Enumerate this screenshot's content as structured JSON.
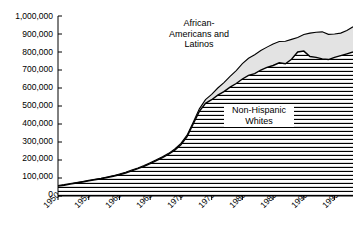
{
  "chart_data": {
    "type": "area",
    "title": "",
    "subtitle": "",
    "xlabel": "",
    "ylabel": "",
    "stacked": true,
    "grid": false,
    "legend_position": "inline-annotations",
    "xlim": [
      1950,
      1998
    ],
    "ylim": [
      0,
      1000000
    ],
    "ytick_step": 100000,
    "ytick_labels": [
      "1,000,000",
      "900,000",
      "800,000",
      "700,000",
      "600,000",
      "500,000",
      "400,000",
      "300,000",
      "200,000",
      "100,000",
      "0"
    ],
    "ytick_values": [
      1000000,
      900000,
      800000,
      700000,
      600000,
      500000,
      400000,
      300000,
      200000,
      100000,
      0
    ],
    "xtick_labels": [
      "1950",
      "1955",
      "1960",
      "1965",
      "1970",
      "1975",
      "1980",
      "1985",
      "1990",
      "1995"
    ],
    "xtick_values": [
      1950,
      1955,
      1960,
      1965,
      1970,
      1975,
      1980,
      1985,
      1990,
      1995
    ],
    "x": [
      1950,
      1951,
      1952,
      1953,
      1954,
      1955,
      1956,
      1957,
      1958,
      1959,
      1960,
      1961,
      1962,
      1963,
      1964,
      1965,
      1966,
      1967,
      1968,
      1969,
      1970,
      1971,
      1972,
      1973,
      1974,
      1975,
      1976,
      1977,
      1978,
      1979,
      1980,
      1981,
      1982,
      1983,
      1984,
      1985,
      1986,
      1987,
      1988,
      1989,
      1990,
      1991,
      1992,
      1993,
      1994,
      1995,
      1996,
      1997,
      1998
    ],
    "series": [
      {
        "name": "Non-Hispanic Whites",
        "fill": "horizontal-hatch",
        "values": [
          55000,
          60000,
          66000,
          72000,
          78000,
          84000,
          90000,
          96000,
          103000,
          110000,
          118000,
          128000,
          140000,
          152000,
          165000,
          180000,
          196000,
          213000,
          232000,
          255000,
          285000,
          330000,
          400000,
          470000,
          515000,
          535000,
          560000,
          580000,
          605000,
          625000,
          650000,
          670000,
          680000,
          700000,
          715000,
          725000,
          740000,
          735000,
          760000,
          800000,
          805000,
          775000,
          770000,
          762000,
          758000,
          770000,
          780000,
          790000,
          800000
        ]
      },
      {
        "name": "African-Americans and Latinos",
        "fill": "light-gray",
        "values": [
          3000,
          3000,
          3000,
          3000,
          3000,
          3000,
          3000,
          3000,
          3000,
          3000,
          4000,
          4000,
          4000,
          4000,
          4000,
          5000,
          5000,
          5000,
          5000,
          6000,
          7000,
          8000,
          10000,
          14000,
          20000,
          30000,
          40000,
          50000,
          60000,
          72000,
          85000,
          95000,
          105000,
          108000,
          112000,
          120000,
          118000,
          125000,
          110000,
          80000,
          92000,
          130000,
          140000,
          150000,
          140000,
          130000,
          125000,
          130000,
          140000
        ]
      }
    ],
    "total_values": [
      58000,
      63000,
      69000,
      75000,
      81000,
      87000,
      93000,
      99000,
      106000,
      113000,
      122000,
      132000,
      144000,
      156000,
      169000,
      185000,
      201000,
      218000,
      237000,
      261000,
      292000,
      338000,
      410000,
      484000,
      535000,
      565000,
      600000,
      630000,
      665000,
      697000,
      735000,
      765000,
      785000,
      808000,
      827000,
      845000,
      858000,
      860000,
      870000,
      880000,
      897000,
      905000,
      910000,
      912000,
      898000,
      900000,
      905000,
      920000,
      940000
    ]
  },
  "annotations": {
    "upper_band": {
      "line1": "African-",
      "line2": "Americans and",
      "line3": "Latinos"
    },
    "lower_band": {
      "line1": "Non-Hispanic",
      "line2": "Whites"
    }
  },
  "colors": {
    "upper_band_fill": "#e3e3e3",
    "lower_band_fill": "#ffffff",
    "hatch_line": "#000000",
    "outline": "#000000",
    "axis": "#000000",
    "background": "#ffffff"
  }
}
